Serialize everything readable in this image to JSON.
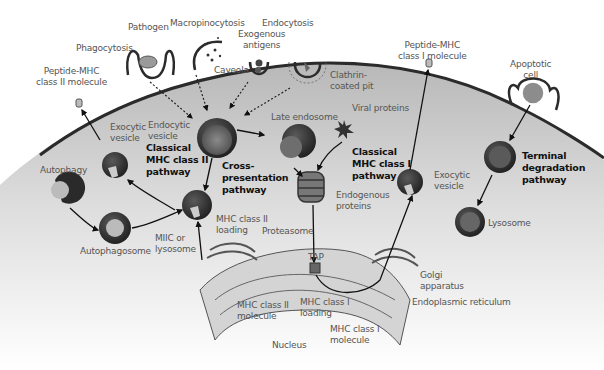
{
  "diagram": {
    "colors": {
      "cytoplasm": "#c9c9c9",
      "membrane": "#2b2b2b",
      "vesicle_dark": "#3a3a3a",
      "vesicle_inner": "#6b6b6b",
      "label_text": "#555555",
      "pathway_text": "#111111",
      "background": "#ffffff"
    },
    "labels": {
      "pathogen": "Pathogen",
      "macropinocytosis": "Macropinocytosis",
      "endocytosis": "Endocytosis",
      "exogenous_antigens_1": "Exogenous",
      "exogenous_antigens_2": "antigens",
      "phagocytosis": "Phagocytosis",
      "caveola": "Caveola",
      "clathrin_1": "Clathrin-",
      "clathrin_2": "coated pit",
      "peptide_mhc2_1": "Peptide-MHC",
      "peptide_mhc2_2": "class II molecule",
      "peptide_mhc1_1": "Peptide-MHC",
      "peptide_mhc1_2": "class I molecule",
      "apoptotic_1": "Apoptotic",
      "apoptotic_2": "cell",
      "exocytic_vesicle_left_1": "Exocytic",
      "exocytic_vesicle_left_2": "vesicle",
      "endocytic_vesicle_1": "Endocytic",
      "endocytic_vesicle_2": "vesicle",
      "late_endosome": "Late endosome",
      "viral_proteins": "Viral proteins",
      "autophagy": "Autophagy",
      "autophagosome": "Autophagosome",
      "miic_1": "MIIC or",
      "miic_2": "lysosome",
      "mhc2_loading_1": "MHC class II",
      "mhc2_loading_2": "loading",
      "proteasome": "Proteasome",
      "endogenous_1": "Endogenous",
      "endogenous_2": "proteins",
      "exocytic_vesicle_right_1": "Exocytic",
      "exocytic_vesicle_right_2": "vesicle",
      "lysosome": "Lysosome",
      "tap": "TAP",
      "golgi_1": "Golgi",
      "golgi_2": "apparatus",
      "er": "Endoplasmic reticulum",
      "mhc2_molecule_1": "MHC class II",
      "mhc2_molecule_2": "molecule",
      "mhc1_loading_1": "MHC class I",
      "mhc1_loading_2": "loading",
      "mhc1_molecule_1": "MHC class I",
      "mhc1_molecule_2": "molecule",
      "nucleus": "Nucleus"
    },
    "pathways": {
      "classical_mhc2_1": "Classical",
      "classical_mhc2_2": "MHC class II",
      "classical_mhc2_3": "pathway",
      "cross_1": "Cross-",
      "cross_2": "presentation",
      "cross_3": "pathway",
      "classical_mhc1_1": "Classical",
      "classical_mhc1_2": "MHC class I",
      "classical_mhc1_3": "pathway",
      "terminal_1": "Terminal",
      "terminal_2": "degradation",
      "terminal_3": "pathway"
    }
  }
}
